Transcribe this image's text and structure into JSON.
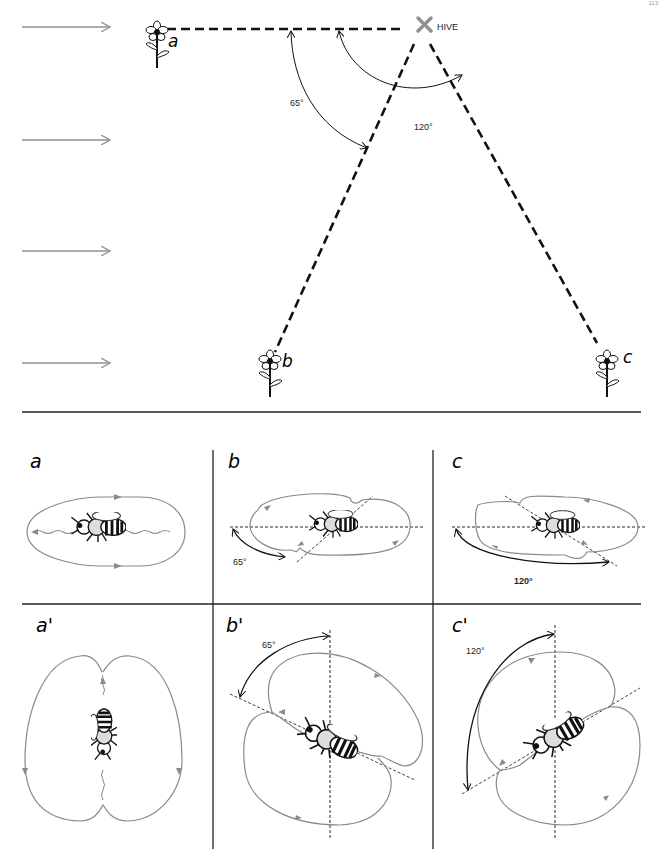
{
  "page": {
    "number": "113"
  },
  "map": {
    "hive_label": "HIVE",
    "flowers": [
      {
        "id": "a",
        "label": "a"
      },
      {
        "id": "b",
        "label": "b"
      },
      {
        "id": "c",
        "label": "c"
      }
    ],
    "angles": [
      {
        "id": "angle-b",
        "value": "65°"
      },
      {
        "id": "angle-c",
        "value": "120°"
      }
    ],
    "sun_direction_arrows": 4
  },
  "dance_panels": {
    "horizontal": [
      {
        "id": "a",
        "label": "a",
        "angle": ""
      },
      {
        "id": "b",
        "label": "b",
        "angle": "65°"
      },
      {
        "id": "c",
        "label": "c",
        "angle": "120°"
      }
    ],
    "vertical": [
      {
        "id": "a-prime",
        "label": "a'",
        "angle": ""
      },
      {
        "id": "b-prime",
        "label": "b'",
        "angle": "65°"
      },
      {
        "id": "c-prime",
        "label": "c'",
        "angle": "120°"
      }
    ]
  },
  "colors": {
    "dance_path": "#8a8a8a",
    "ink": "#111111",
    "arrow_gray": "#909090"
  }
}
